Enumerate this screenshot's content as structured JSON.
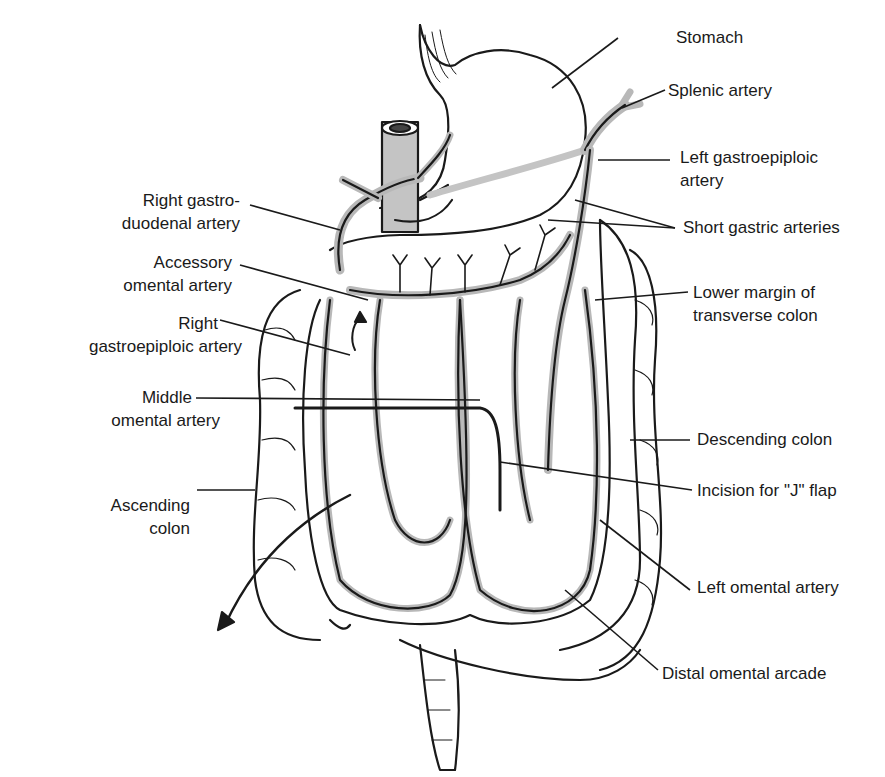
{
  "figure": {
    "kind": "anatomical illustration",
    "colors": {
      "line": "#1a1a1a",
      "vessel": "#b8b8b8",
      "background": "#ffffff"
    }
  },
  "labels": {
    "stomach": "Stomach",
    "splenic_artery": "Splenic artery",
    "left_gastroepiploic_1": "Left gastroepiploic",
    "left_gastroepiploic_2": "artery",
    "short_gastric": "Short gastric arteries",
    "lower_margin_1": "Lower margin of",
    "lower_margin_2": "transverse colon",
    "descending_colon": "Descending colon",
    "incision_j": "Incision for \"J\" flap",
    "left_omental": "Left omental artery",
    "distal_arcade": "Distal omental arcade",
    "right_gastroduodenal_1": "Right gastro-",
    "right_gastroduodenal_2": "duodenal artery",
    "accessory_omental_1": "Accessory",
    "accessory_omental_2": "omental artery",
    "right_gastroepiploic_1": "Right",
    "right_gastroepiploic_2": "gastroepiploic artery",
    "middle_omental_1": "Middle",
    "middle_omental_2": "omental artery",
    "ascending_colon_1": "Ascending",
    "ascending_colon_2": "colon"
  }
}
